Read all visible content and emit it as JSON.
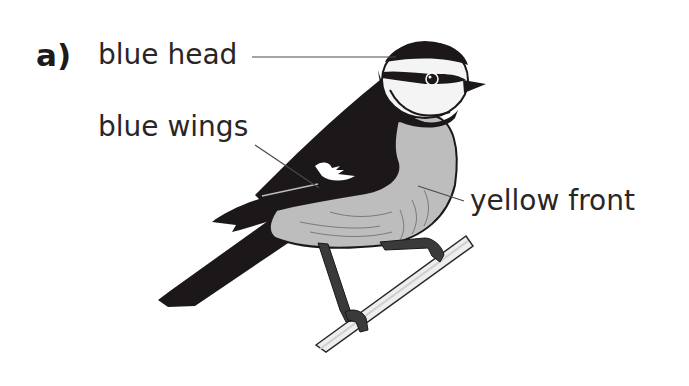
{
  "question": {
    "number_label": "a)"
  },
  "labels": {
    "head": "blue head",
    "wings": "blue wings",
    "front": "yellow front"
  },
  "colors": {
    "text": "#2a2626",
    "bird_dark": "#1c1719",
    "bird_body": "#b8b8b8",
    "bird_face": "#f4f4f4",
    "branch": "#e6e6e6",
    "leader_line": "#4a4a4a"
  }
}
